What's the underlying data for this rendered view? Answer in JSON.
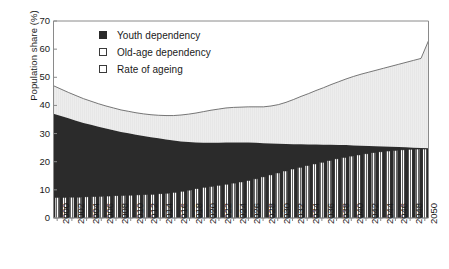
{
  "chart_data": {
    "type": "area",
    "title": "",
    "subtitle": "",
    "xlabel": "",
    "ylabel": "Population share (%)",
    "xlim": [
      2000,
      2050
    ],
    "ylim": [
      0,
      70
    ],
    "ytick_labels": [
      "0",
      "10",
      "20",
      "30",
      "40",
      "50",
      "60",
      "70"
    ],
    "ytick_values": [
      0,
      10,
      20,
      30,
      40,
      50,
      60,
      70
    ],
    "grid": false,
    "legend_position": "upper-center-left",
    "legend": [
      {
        "label": "Youth dependency",
        "marker": "filled-square",
        "color": "#2b2b2b"
      },
      {
        "label": "Old-age dependency",
        "marker": "open-square",
        "color": "#ebebeb"
      },
      {
        "label": "Rate of ageing",
        "marker": "open-square",
        "color": "#ffffff"
      }
    ],
    "x": [
      2000,
      2001,
      2002,
      2003,
      2004,
      2005,
      2006,
      2007,
      2008,
      2009,
      2010,
      2011,
      2012,
      2013,
      2014,
      2015,
      2016,
      2017,
      2018,
      2019,
      2020,
      2021,
      2022,
      2023,
      2024,
      2025,
      2026,
      2027,
      2028,
      2029,
      2030,
      2031,
      2032,
      2033,
      2034,
      2035,
      2036,
      2037,
      2038,
      2039,
      2040,
      2041,
      2042,
      2043,
      2044,
      2045,
      2046,
      2047,
      2048,
      2049,
      2050
    ],
    "xtick_labels": [
      "2000",
      "2002",
      "2004",
      "2006",
      "2008",
      "2010",
      "2012",
      "2014",
      "2016",
      "2018",
      "2020",
      "2022",
      "2024",
      "2026",
      "2028",
      "2030",
      "2032",
      "2034",
      "2036",
      "2038",
      "2040",
      "2042",
      "2044",
      "2046",
      "2048",
      "2050"
    ],
    "series": [
      {
        "name": "Youth dependency",
        "kind": "stacked-area",
        "color": "#2b2b2b",
        "values": [
          37.0,
          36.2,
          35.4,
          34.6,
          33.8,
          33.1,
          32.4,
          31.8,
          31.2,
          30.6,
          30.1,
          29.6,
          29.1,
          28.7,
          28.3,
          27.9,
          27.5,
          27.2,
          27.0,
          26.8,
          26.7,
          26.7,
          26.7,
          26.8,
          26.8,
          26.8,
          26.8,
          26.7,
          26.6,
          26.5,
          26.4,
          26.3,
          26.2,
          26.2,
          26.1,
          26.1,
          26.0,
          26.0,
          25.9,
          25.9,
          25.8,
          25.7,
          25.6,
          25.5,
          25.4,
          25.3,
          25.2,
          25.1,
          25.0,
          24.9,
          24.8
        ]
      },
      {
        "name": "Old-age dependency",
        "kind": "stacked-area",
        "color": "#ebebeb",
        "values": [
          10.0,
          9.6,
          9.2,
          8.9,
          8.6,
          8.4,
          8.2,
          8.0,
          7.9,
          7.8,
          7.8,
          7.8,
          7.9,
          8.0,
          8.2,
          8.5,
          8.9,
          9.4,
          9.9,
          10.5,
          11.1,
          11.6,
          12.0,
          12.3,
          12.5,
          12.6,
          12.7,
          12.8,
          12.9,
          13.3,
          13.9,
          14.8,
          15.9,
          17.0,
          18.1,
          19.2,
          20.3,
          21.4,
          22.5,
          23.5,
          24.5,
          25.4,
          26.2,
          27.0,
          27.8,
          28.6,
          29.4,
          30.2,
          31.0,
          31.8,
          38.2
        ]
      },
      {
        "name": "Rate of ageing",
        "kind": "bar",
        "color": "#ffffff",
        "values": [
          7.3,
          7.3,
          7.4,
          7.4,
          7.5,
          7.6,
          7.7,
          7.8,
          7.9,
          8.0,
          8.1,
          8.2,
          8.3,
          8.4,
          8.6,
          8.8,
          9.1,
          9.5,
          9.9,
          10.4,
          10.9,
          11.2,
          11.6,
          12.0,
          12.4,
          12.8,
          13.3,
          13.9,
          14.6,
          15.3,
          16.0,
          16.7,
          17.4,
          18.0,
          18.6,
          19.2,
          19.8,
          20.4,
          21.0,
          21.5,
          22.0,
          22.4,
          22.8,
          23.2,
          23.5,
          23.8,
          24.0,
          24.2,
          24.4,
          24.5,
          24.5
        ]
      }
    ],
    "total_top_line": [
      47.0,
      45.8,
      44.6,
      43.5,
      42.4,
      41.5,
      40.6,
      39.8,
      39.1,
      38.4,
      37.9,
      37.4,
      37.0,
      36.7,
      36.5,
      36.4,
      36.4,
      36.6,
      36.9,
      37.3,
      37.8,
      38.3,
      38.7,
      39.1,
      39.3,
      39.4,
      39.5,
      39.5,
      39.5,
      39.8,
      40.3,
      41.1,
      42.1,
      43.2,
      44.2,
      45.3,
      46.3,
      47.4,
      48.4,
      49.4,
      50.3,
      51.1,
      51.8,
      52.5,
      53.2,
      53.9,
      54.6,
      55.3,
      56.0,
      56.7,
      63.0
    ]
  }
}
